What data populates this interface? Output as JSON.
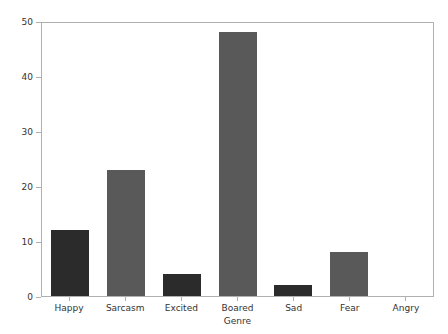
{
  "chart_data": {
    "type": "bar",
    "title": "",
    "xlabel": "Genre",
    "ylabel": "",
    "categories": [
      "Happy",
      "Sarcasm",
      "Excited",
      "Boared",
      "Sad",
      "Fear",
      "Angry"
    ],
    "values": [
      12,
      23,
      4,
      48,
      2,
      8,
      0
    ],
    "bar_colors": [
      "#2b2b2b",
      "#595959",
      "#2b2b2b",
      "#595959",
      "#2b2b2b",
      "#595959",
      "#595959"
    ],
    "ylim": [
      0,
      50
    ],
    "yticks": [
      0,
      10,
      20,
      30,
      40,
      50
    ],
    "ytick_labels": [
      "0",
      "10",
      "20",
      "30",
      "40",
      "50"
    ],
    "grid": false,
    "legend": null,
    "legend_position": "none"
  }
}
